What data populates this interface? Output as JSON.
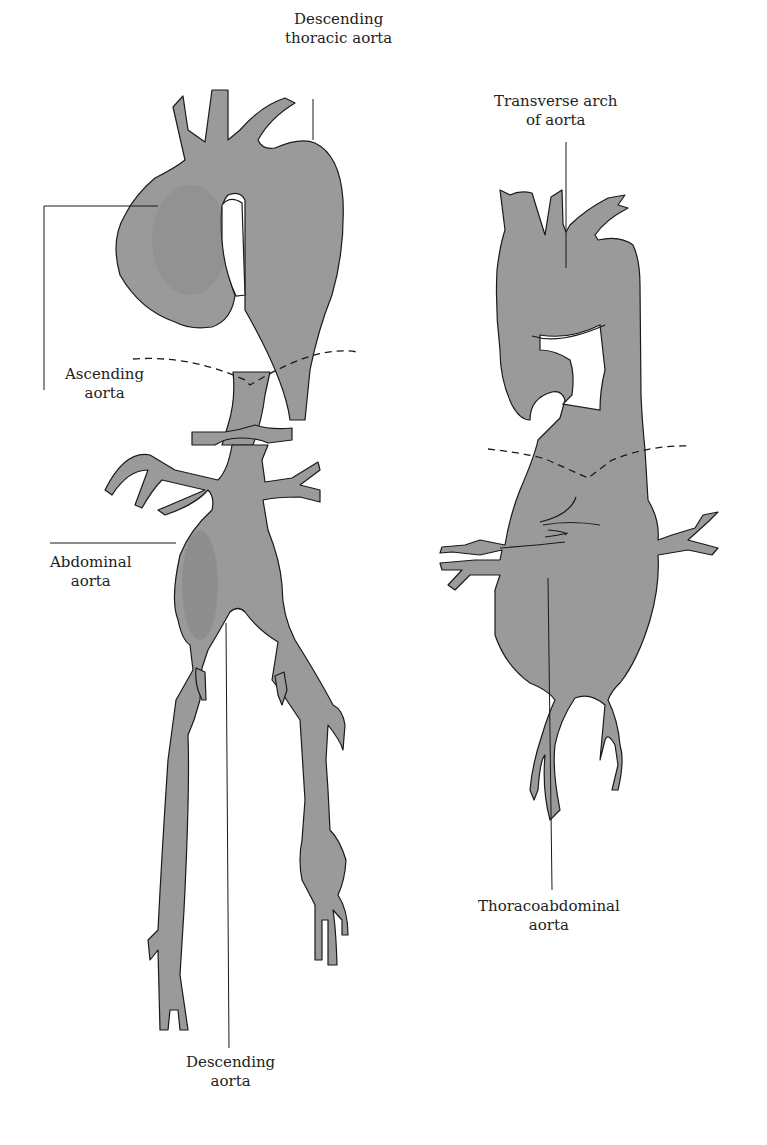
{
  "figure": {
    "left_panel": {
      "name": "Extensive aneurysmal aorta (left)",
      "labels": {
        "descending_thoracic": [
          "Descending",
          "thoracic aorta"
        ],
        "ascending": [
          "Ascending",
          "aorta"
        ],
        "abdominal": [
          "Abdominal",
          "aorta"
        ],
        "descending": [
          "Descending",
          "aorta"
        ]
      }
    },
    "right_panel": {
      "name": "Thoracoabdominal aneurysm (right)",
      "labels": {
        "transverse_arch": [
          "Transverse arch",
          "of aorta"
        ],
        "thoracoabdominal": [
          "Thoracoabdominal",
          "aorta"
        ]
      }
    },
    "colors": {
      "vessel_fill": "#9a9a9a",
      "outline": "#1a1a1a",
      "background": "#ffffff"
    }
  }
}
